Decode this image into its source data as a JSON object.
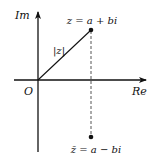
{
  "diagram": {
    "axes": {
      "imaginary_label": "Im",
      "real_label": "Re",
      "origin_label": "O"
    },
    "point_z": {
      "label": "z = a + bi"
    },
    "modulus_label": "|z|",
    "point_conjugate": {
      "label": "z̄ = a − bi"
    },
    "colors": {
      "ink": "#111111",
      "dashed": "#555555",
      "background": "#ffffff"
    }
  }
}
